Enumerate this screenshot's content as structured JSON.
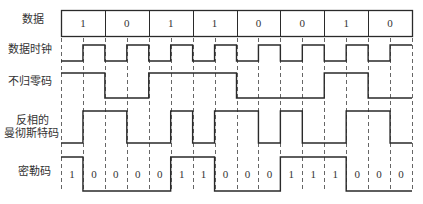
{
  "diagram": {
    "colors": {
      "line": "#2a2a2a",
      "dash": "#555555",
      "text": "#333333"
    },
    "layout": {
      "x_start": 61,
      "x_end": 412,
      "bit_width": 43.875,
      "data_box": {
        "top": 10,
        "bottom": 36
      },
      "dash_top": 38,
      "dash_bottom": 192
    },
    "rows": {
      "data": {
        "label": "数据",
        "bits": [
          "1",
          "0",
          "1",
          "1",
          "0",
          "0",
          "1",
          "0"
        ]
      },
      "clock": {
        "label": "数据时钟",
        "high_y": 45,
        "low_y": 61,
        "levels": [
          0,
          1,
          0,
          1,
          0,
          1,
          0,
          1,
          0,
          1,
          0,
          1,
          0,
          1,
          0,
          1
        ]
      },
      "nrz": {
        "label": "不归零码",
        "high_y": 73,
        "low_y": 98,
        "levels": [
          1,
          1,
          0,
          0,
          1,
          1,
          1,
          1,
          0,
          0,
          0,
          0,
          1,
          1,
          0,
          0
        ]
      },
      "manchester": {
        "label_line1": "反相的",
        "label_line2": "曼彻斯特码",
        "high_y": 111,
        "low_y": 143,
        "levels": [
          0,
          1,
          1,
          0,
          0,
          1,
          0,
          1,
          1,
          0,
          1,
          0,
          0,
          1,
          1,
          0
        ]
      },
      "miller": {
        "label": "密勒码",
        "high_y": 157,
        "low_y": 191,
        "levels": [
          1,
          0,
          0,
          0,
          0,
          1,
          1,
          0,
          0,
          0,
          1,
          1,
          1,
          0,
          0,
          0
        ],
        "half_bit_labels": [
          "1",
          "0",
          "0",
          "0",
          "0",
          "1",
          "1",
          "0",
          "0",
          "0",
          "1",
          "1",
          "1",
          "0",
          "0",
          "0"
        ]
      }
    }
  }
}
